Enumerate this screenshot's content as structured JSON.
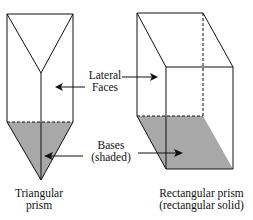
{
  "labels": {
    "lateral_line1": "Lateral",
    "lateral_line2": "Faces",
    "bases_line1": "Bases",
    "bases_line2": "(shaded)",
    "triangular_line1": "Triangular",
    "triangular_line2": "prism",
    "rectangular_line1": "Rectangular prism",
    "rectangular_line2": "(rectangular solid)"
  },
  "colors": {
    "stroke": "#111111",
    "base_fill": "#a8a8a8"
  }
}
